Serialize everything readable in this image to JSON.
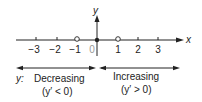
{
  "axes": {
    "x_label": "x",
    "y_label": "y"
  },
  "ticks": [
    {
      "value": -3,
      "label": "−3",
      "px": 36,
      "marker": "tick"
    },
    {
      "value": -2,
      "label": "−2",
      "px": 57,
      "marker": "tick"
    },
    {
      "value": -1,
      "label": "−1",
      "px": 77,
      "marker": "open-circle"
    },
    {
      "value": 0,
      "label": "0",
      "px": 97,
      "marker": "filled-dot"
    },
    {
      "value": 1,
      "label": "1",
      "px": 118,
      "marker": "open-circle"
    },
    {
      "value": 2,
      "label": "2",
      "px": 138,
      "marker": "tick"
    },
    {
      "value": 3,
      "label": "3",
      "px": 158,
      "marker": "tick"
    }
  ],
  "intervals": {
    "prefix": "y:",
    "left": {
      "label": "Decreasing",
      "condition": "(y′ < 0)"
    },
    "right": {
      "label": "Increasing",
      "condition": "(y′ > 0)"
    }
  },
  "colors": {
    "ink": "#222222",
    "zero_label": "#999999",
    "background": "#ffffff"
  }
}
